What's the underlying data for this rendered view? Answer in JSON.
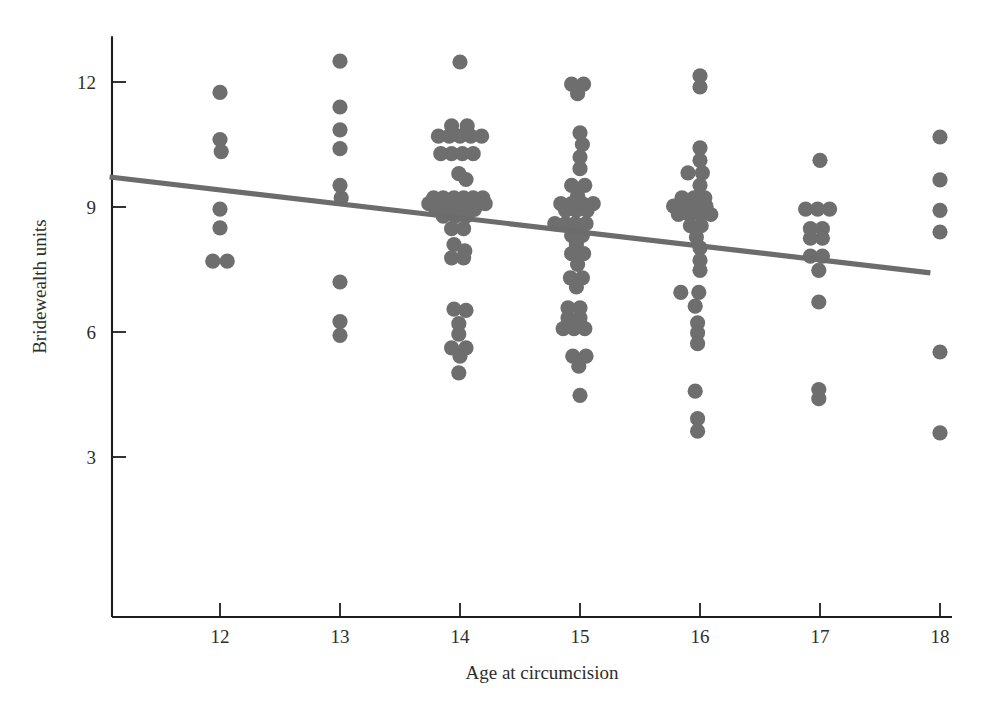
{
  "figure": {
    "background": "#ffffff",
    "point_color": "#6e6e6e",
    "line_color": "#6c6c6c",
    "axis_color": "#1d1d1d"
  },
  "chart_data": {
    "type": "scatter",
    "title": "",
    "xlabel": "Age at circumcision",
    "ylabel": "Bridewealth units",
    "xlim": [
      11.1,
      18.1
    ],
    "ylim": [
      1.3,
      13.1
    ],
    "xticks": [
      12,
      13,
      14,
      15,
      16,
      17,
      18
    ],
    "yticks": [
      3,
      6,
      9,
      12
    ],
    "xtick_labels": [
      "12",
      "13",
      "14",
      "15",
      "16",
      "17",
      "18"
    ],
    "ytick_labels": [
      "3",
      "6",
      "9",
      "12"
    ],
    "grid": false,
    "legend": null,
    "jitter": "horizontal jitter applied to overlapping points at each integer age",
    "series": [
      {
        "name": "observations",
        "marker": "filled circle",
        "color": "#6e6e6e",
        "points": [
          [
            12.0,
            11.75
          ],
          [
            12.0,
            10.62
          ],
          [
            12.01,
            10.33
          ],
          [
            12.0,
            8.95
          ],
          [
            12.0,
            8.5
          ],
          [
            11.94,
            7.7
          ],
          [
            12.06,
            7.7
          ],
          [
            13.0,
            12.5
          ],
          [
            13.0,
            11.4
          ],
          [
            13.0,
            10.85
          ],
          [
            13.0,
            10.4
          ],
          [
            13.0,
            9.52
          ],
          [
            13.01,
            9.22
          ],
          [
            13.0,
            7.2
          ],
          [
            13.0,
            6.25
          ],
          [
            13.0,
            5.92
          ],
          [
            14.0,
            12.48
          ],
          [
            13.93,
            10.95
          ],
          [
            14.06,
            10.95
          ],
          [
            13.82,
            10.7
          ],
          [
            13.91,
            10.7
          ],
          [
            14.0,
            10.7
          ],
          [
            14.09,
            10.7
          ],
          [
            14.18,
            10.7
          ],
          [
            13.84,
            10.28
          ],
          [
            13.93,
            10.28
          ],
          [
            14.02,
            10.28
          ],
          [
            14.11,
            10.28
          ],
          [
            13.99,
            9.8
          ],
          [
            14.05,
            9.66
          ],
          [
            13.78,
            9.22
          ],
          [
            13.86,
            9.22
          ],
          [
            13.95,
            9.22
          ],
          [
            14.03,
            9.22
          ],
          [
            14.11,
            9.22
          ],
          [
            14.19,
            9.22
          ],
          [
            13.74,
            9.08
          ],
          [
            13.82,
            9.08
          ],
          [
            13.9,
            9.08
          ],
          [
            13.98,
            9.08
          ],
          [
            14.06,
            9.08
          ],
          [
            14.14,
            9.08
          ],
          [
            14.21,
            9.08
          ],
          [
            13.8,
            8.94
          ],
          [
            13.88,
            8.94
          ],
          [
            13.96,
            8.94
          ],
          [
            14.04,
            8.94
          ],
          [
            14.12,
            8.94
          ],
          [
            13.86,
            8.78
          ],
          [
            13.96,
            8.78
          ],
          [
            14.05,
            8.78
          ],
          [
            13.93,
            8.48
          ],
          [
            14.03,
            8.48
          ],
          [
            13.95,
            8.1
          ],
          [
            14.04,
            7.95
          ],
          [
            13.93,
            7.78
          ],
          [
            14.03,
            7.78
          ],
          [
            13.95,
            6.55
          ],
          [
            14.05,
            6.52
          ],
          [
            13.99,
            6.2
          ],
          [
            13.99,
            5.95
          ],
          [
            13.93,
            5.62
          ],
          [
            14.05,
            5.62
          ],
          [
            14.0,
            5.42
          ],
          [
            13.99,
            5.02
          ],
          [
            14.93,
            11.95
          ],
          [
            15.03,
            11.95
          ],
          [
            14.98,
            11.72
          ],
          [
            15.0,
            10.78
          ],
          [
            15.02,
            10.5
          ],
          [
            15.0,
            10.2
          ],
          [
            15.0,
            9.92
          ],
          [
            14.93,
            9.52
          ],
          [
            15.04,
            9.52
          ],
          [
            14.98,
            9.28
          ],
          [
            14.84,
            9.08
          ],
          [
            14.93,
            9.08
          ],
          [
            15.02,
            9.08
          ],
          [
            15.11,
            9.08
          ],
          [
            14.88,
            8.92
          ],
          [
            14.97,
            8.92
          ],
          [
            15.06,
            8.92
          ],
          [
            14.79,
            8.6
          ],
          [
            14.88,
            8.6
          ],
          [
            14.96,
            8.6
          ],
          [
            15.05,
            8.6
          ],
          [
            14.93,
            8.32
          ],
          [
            15.02,
            8.32
          ],
          [
            14.97,
            8.1
          ],
          [
            14.93,
            7.88
          ],
          [
            15.03,
            7.88
          ],
          [
            14.98,
            7.62
          ],
          [
            14.92,
            7.3
          ],
          [
            15.02,
            7.3
          ],
          [
            14.97,
            7.08
          ],
          [
            14.9,
            6.58
          ],
          [
            15.0,
            6.58
          ],
          [
            14.9,
            6.34
          ],
          [
            15.0,
            6.34
          ],
          [
            14.86,
            6.08
          ],
          [
            14.95,
            6.08
          ],
          [
            15.04,
            6.08
          ],
          [
            14.94,
            5.42
          ],
          [
            15.05,
            5.42
          ],
          [
            14.99,
            5.18
          ],
          [
            15.0,
            4.48
          ],
          [
            16.0,
            12.15
          ],
          [
            16.0,
            11.88
          ],
          [
            16.0,
            10.42
          ],
          [
            16.0,
            10.12
          ],
          [
            15.9,
            9.82
          ],
          [
            16.02,
            9.82
          ],
          [
            16.0,
            9.52
          ],
          [
            15.85,
            9.22
          ],
          [
            15.95,
            9.22
          ],
          [
            16.04,
            9.22
          ],
          [
            15.78,
            9.02
          ],
          [
            15.87,
            9.02
          ],
          [
            15.96,
            9.02
          ],
          [
            16.05,
            9.02
          ],
          [
            15.82,
            8.82
          ],
          [
            15.91,
            8.82
          ],
          [
            16.0,
            8.82
          ],
          [
            16.09,
            8.82
          ],
          [
            15.92,
            8.55
          ],
          [
            16.01,
            8.55
          ],
          [
            15.97,
            8.28
          ],
          [
            16.0,
            8.02
          ],
          [
            16.0,
            7.72
          ],
          [
            16.0,
            7.48
          ],
          [
            15.84,
            6.95
          ],
          [
            15.99,
            6.95
          ],
          [
            15.96,
            6.62
          ],
          [
            15.98,
            6.22
          ],
          [
            15.98,
            5.98
          ],
          [
            15.98,
            5.72
          ],
          [
            15.96,
            4.58
          ],
          [
            15.98,
            3.92
          ],
          [
            15.98,
            3.62
          ],
          [
            17.0,
            10.12
          ],
          [
            16.88,
            8.95
          ],
          [
            16.98,
            8.95
          ],
          [
            17.08,
            8.95
          ],
          [
            16.92,
            8.48
          ],
          [
            17.02,
            8.48
          ],
          [
            16.92,
            8.25
          ],
          [
            17.02,
            8.25
          ],
          [
            16.92,
            7.82
          ],
          [
            17.02,
            7.82
          ],
          [
            16.99,
            7.48
          ],
          [
            16.99,
            6.72
          ],
          [
            16.99,
            4.62
          ],
          [
            16.99,
            4.4
          ],
          [
            18.0,
            10.68
          ],
          [
            18.0,
            9.65
          ],
          [
            18.0,
            8.92
          ],
          [
            18.0,
            8.4
          ],
          [
            18.0,
            5.52
          ],
          [
            18.0,
            3.58
          ]
        ]
      }
    ],
    "trend_line": {
      "name": "least-squares fit",
      "type": "line",
      "color": "#6c6c6c",
      "x_start": 11.08,
      "y_start": 9.72,
      "x_end": 17.92,
      "y_end": 7.42,
      "slope": -0.336,
      "intercept": 13.44
    }
  }
}
